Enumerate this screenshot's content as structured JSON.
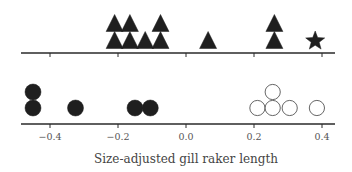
{
  "chart_data": {
    "type": "scatter",
    "subtype": "stacked dot plot (two panels sharing x-axis)",
    "title": "",
    "xlabel": "Size-adjusted gill raker length",
    "ylabel": "",
    "xlim": [
      -0.48,
      0.44
    ],
    "xticks": [
      -0.4,
      -0.2,
      0.0,
      0.2,
      0.4
    ],
    "xtick_labels": [
      "−0.4",
      "−0.2",
      "0.0",
      "0.2",
      "0.4"
    ],
    "grid": false,
    "legend": null,
    "panels": [
      {
        "name": "top",
        "series": [
          {
            "name": "triangles",
            "marker": "triangle",
            "fill": "#1f1f1f",
            "stroke": "#1f1f1f",
            "points": [
              {
                "x": -0.21,
                "stack": 0
              },
              {
                "x": -0.21,
                "stack": 1
              },
              {
                "x": -0.165,
                "stack": 0
              },
              {
                "x": -0.165,
                "stack": 1
              },
              {
                "x": -0.12,
                "stack": 0
              },
              {
                "x": -0.075,
                "stack": 0
              },
              {
                "x": -0.075,
                "stack": 1
              },
              {
                "x": 0.065,
                "stack": 0
              },
              {
                "x": 0.26,
                "stack": 0
              },
              {
                "x": 0.26,
                "stack": 1
              }
            ]
          },
          {
            "name": "star",
            "marker": "star",
            "fill": "#1f1f1f",
            "stroke": "#1f1f1f",
            "points": [
              {
                "x": 0.38,
                "stack": 0
              }
            ]
          }
        ]
      },
      {
        "name": "bottom",
        "series": [
          {
            "name": "filled circles",
            "marker": "circle",
            "fill": "#1f1f1f",
            "stroke": "#1f1f1f",
            "points": [
              {
                "x": -0.45,
                "stack": 0
              },
              {
                "x": -0.45,
                "stack": 1
              },
              {
                "x": -0.325,
                "stack": 0
              },
              {
                "x": -0.15,
                "stack": 0
              },
              {
                "x": -0.105,
                "stack": 0
              }
            ]
          },
          {
            "name": "open circles",
            "marker": "circle",
            "fill": "#ffffff",
            "stroke": "#555555",
            "points": [
              {
                "x": 0.21,
                "stack": 0
              },
              {
                "x": 0.255,
                "stack": 0
              },
              {
                "x": 0.255,
                "stack": 1
              },
              {
                "x": 0.305,
                "stack": 0
              },
              {
                "x": 0.385,
                "stack": 0
              }
            ]
          }
        ]
      }
    ]
  }
}
